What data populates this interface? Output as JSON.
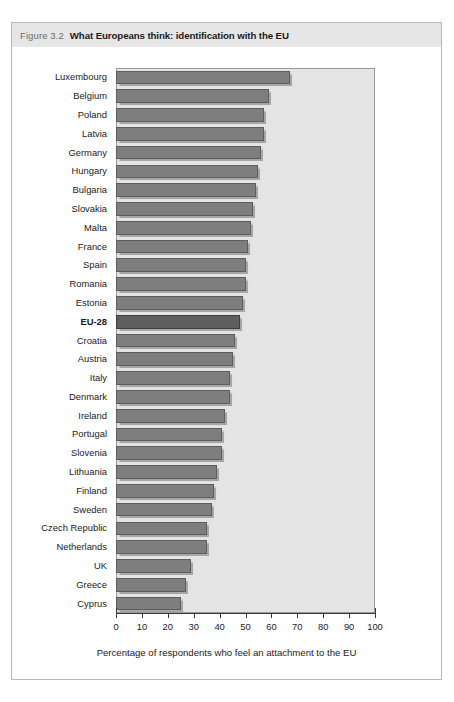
{
  "figure": {
    "number": "Figure 3.2",
    "title": "What Europeans think: identification with the EU"
  },
  "chart_data": {
    "type": "bar",
    "orientation": "horizontal",
    "title": "What Europeans think: identification with the EU",
    "xlabel": "Percentage of respondents who feel an attachment to the EU",
    "ylabel": "",
    "xlim": [
      0,
      100
    ],
    "xticks": [
      0,
      10,
      20,
      30,
      40,
      50,
      60,
      70,
      80,
      90,
      100
    ],
    "xtick_labels": [
      "0",
      "10",
      "20",
      "30",
      "40",
      "50",
      "60",
      "70",
      "80",
      "90",
      "100"
    ],
    "grid": false,
    "legend": "none",
    "highlight_category": "EU-28",
    "plot_background": "#e4e4e4",
    "bar_color": "#7e7e7e",
    "bar_highlight_color": "#5e5e5e",
    "categories": [
      "Luxembourg",
      "Belgium",
      "Poland",
      "Latvia",
      "Germany",
      "Hungary",
      "Bulgaria",
      "Slovakia",
      "Malta",
      "France",
      "Spain",
      "Romania",
      "Estonia",
      "EU-28",
      "Croatia",
      "Austria",
      "Italy",
      "Denmark",
      "Ireland",
      "Portugal",
      "Slovenia",
      "Lithuania",
      "Finland",
      "Sweden",
      "Czech Republic",
      "Netherlands",
      "UK",
      "Greece",
      "Cyprus"
    ],
    "values": [
      67,
      59,
      57,
      57,
      56,
      55,
      54,
      53,
      52,
      51,
      50,
      50,
      49,
      48,
      46,
      45,
      44,
      44,
      42,
      41,
      41,
      39,
      38,
      37,
      35,
      35,
      29,
      27,
      25
    ]
  }
}
